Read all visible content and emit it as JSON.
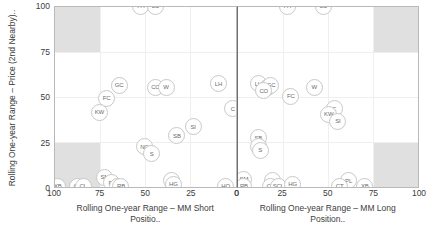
{
  "chart_data": {
    "type": "scatter",
    "title": "",
    "ylabel": "Rolling One-year Range – Price (2nd Nearby)..",
    "ylim": [
      0,
      100
    ],
    "yticks": [
      100,
      75,
      50,
      25,
      0
    ],
    "grid": true,
    "legend": "none",
    "panels": [
      {
        "xlabel": "Rolling One-year Range – MM Short Positio..",
        "xticks": [
          100,
          75,
          50,
          25,
          0
        ],
        "xlim": [
          100,
          0
        ],
        "x_reversed": true,
        "shaded_quadrants": [
          "top-left",
          "bottom-left"
        ],
        "points": [
          {
            "label": "PA",
            "x": 53,
            "y": 101
          },
          {
            "label": "LC",
            "x": 45,
            "y": 101
          },
          {
            "label": "GC",
            "x": 65,
            "y": 57
          },
          {
            "label": "CC",
            "x": 45,
            "y": 56
          },
          {
            "label": "W",
            "x": 39,
            "y": 56
          },
          {
            "label": "LH",
            "x": 10,
            "y": 58
          },
          {
            "label": "FC",
            "x": 72,
            "y": 50
          },
          {
            "label": "C",
            "x": 2,
            "y": 44
          },
          {
            "label": "KW",
            "x": 76,
            "y": 42
          },
          {
            "label": "SI",
            "x": 24,
            "y": 34
          },
          {
            "label": "SB",
            "x": 33,
            "y": 29
          },
          {
            "label": "NG",
            "x": 51,
            "y": 23
          },
          {
            "label": "S",
            "x": 47,
            "y": 19
          },
          {
            "label": "SM",
            "x": 73,
            "y": 6
          },
          {
            "label": "PL",
            "x": 69,
            "y": 3
          },
          {
            "label": "CO",
            "x": 66,
            "y": 1
          },
          {
            "label": "RB",
            "x": 64,
            "y": 1
          },
          {
            "label": "XB",
            "x": 99,
            "y": 1
          },
          {
            "label": "QS",
            "x": 88,
            "y": 1
          },
          {
            "label": "CL",
            "x": 85,
            "y": 1
          },
          {
            "label": "KC",
            "x": 36,
            "y": 4
          },
          {
            "label": "HG",
            "x": 35,
            "y": 2
          },
          {
            "label": "HO",
            "x": 6,
            "y": 1
          }
        ]
      },
      {
        "xlabel": "Rolling One-year Range – MM Long Position..",
        "xticks": [
          0,
          25,
          50,
          75,
          100
        ],
        "xlim": [
          0,
          100
        ],
        "x_reversed": false,
        "shaded_quadrants": [
          "top-right",
          "bottom-right"
        ],
        "points": [
          {
            "label": "PA",
            "x": 27,
            "y": 101
          },
          {
            "label": "LC",
            "x": 47,
            "y": 101
          },
          {
            "label": "LH",
            "x": 11,
            "y": 58
          },
          {
            "label": "CC",
            "x": 16,
            "y": 56
          },
          {
            "label": "GC",
            "x": 18,
            "y": 57
          },
          {
            "label": "CO",
            "x": 14,
            "y": 54
          },
          {
            "label": "W",
            "x": 42,
            "y": 56
          },
          {
            "label": "FC",
            "x": 29,
            "y": 51
          },
          {
            "label": "C",
            "x": 53,
            "y": 44
          },
          {
            "label": "KW",
            "x": 50,
            "y": 41
          },
          {
            "label": "SI",
            "x": 55,
            "y": 37
          },
          {
            "label": "SB",
            "x": 11,
            "y": 28
          },
          {
            "label": "NG",
            "x": 11,
            "y": 23
          },
          {
            "label": "S",
            "x": 12,
            "y": 21
          },
          {
            "label": "SM",
            "x": 3,
            "y": 5
          },
          {
            "label": "RB",
            "x": 3,
            "y": 1
          },
          {
            "label": "KC",
            "x": 19,
            "y": 4
          },
          {
            "label": "CO2",
            "x": 18,
            "y": 1
          },
          {
            "label": "SCL",
            "x": 22,
            "y": 1
          },
          {
            "label": "HG",
            "x": 30,
            "y": 2
          },
          {
            "label": "PL",
            "x": 61,
            "y": 4
          },
          {
            "label": "CT",
            "x": 56,
            "y": 1
          },
          {
            "label": "XB",
            "x": 70,
            "y": 1
          }
        ]
      }
    ]
  }
}
